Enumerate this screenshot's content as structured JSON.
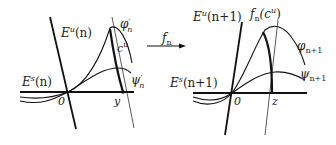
{
  "left_panel": {
    "unstable_label": "E",
    "unstable_sup": "u",
    "unstable_arg": "(n)",
    "stable_label": "E",
    "stable_sup": "s",
    "stable_arg": "(n)",
    "phi_label": "φ",
    "phi_sub": "n",
    "phi_prime": "′",
    "psi_label": "ψ",
    "psi_sub": "n",
    "psi_prime": "′",
    "curve_label": "c",
    "curve_sup": "u",
    "origin_label": "0",
    "point_label": "y"
  },
  "map": {
    "label": "f",
    "sub": "n"
  },
  "right_panel": {
    "unstable_label": "E",
    "unstable_sup": "u",
    "unstable_arg": "(n+1)",
    "stable_label": "E",
    "stable_sup": "s",
    "stable_arg": "(n+1)",
    "image_label": "f",
    "image_sub": "n",
    "image_arg_open": "(c",
    "image_arg_sup": "u",
    "image_arg_close": ")",
    "phi_label": "φ",
    "phi_sub": "n+1",
    "psi_label": "ψ",
    "psi_sub": "n+1",
    "origin_label": "0",
    "point_label": "z"
  }
}
